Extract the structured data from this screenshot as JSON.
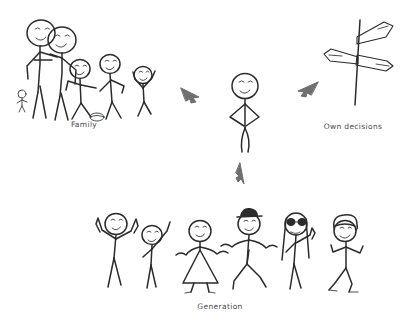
{
  "page": {
    "background_color": "#ffffff",
    "ink_color": "#2b2b2b",
    "arrow_color": "#6f6f6f",
    "width": 414,
    "height": 328
  },
  "captions": {
    "family": "Family",
    "own_decisions": "Own decisions",
    "generation": "Generation"
  },
  "groups": {
    "family": {
      "label": "Family",
      "figure_count": 6,
      "figures": [
        {
          "name": "parent-left",
          "pose": "standing, arm around partner",
          "features": "smiling face"
        },
        {
          "name": "parent-right",
          "pose": "standing, arm around partner",
          "features": "smiling face"
        },
        {
          "name": "toddler",
          "pose": "small figure at parents' feet",
          "features": "tiny child"
        },
        {
          "name": "child-1",
          "pose": "walking, arms out",
          "features": "smiling face, ball at feet"
        },
        {
          "name": "child-2",
          "pose": "standing, arms out",
          "features": "smiling face"
        },
        {
          "name": "child-3",
          "pose": "arms raised up",
          "features": "smiling face"
        }
      ],
      "props": [
        "ball"
      ]
    },
    "generation": {
      "label": "Generation",
      "figure_count": 6,
      "figures": [
        {
          "name": "peer-1",
          "pose": "both arms raised overhead",
          "features": "smiling face"
        },
        {
          "name": "peer-2",
          "pose": "one arm raised waving",
          "features": "smiling face"
        },
        {
          "name": "peer-3",
          "pose": "arms outstretched, holding hands",
          "features": "wearing a dress"
        },
        {
          "name": "peer-4",
          "pose": "arms outstretched, holding hands, legs striding",
          "features": "wearing a hat"
        },
        {
          "name": "peer-5",
          "pose": "hand raised",
          "features": "sunglasses and long hair"
        },
        {
          "name": "peer-6",
          "pose": "walking, arms bent",
          "features": "curly hair"
        }
      ]
    },
    "own_decisions": {
      "label": "Own decisions",
      "icon": "signpost-icon",
      "description": "signpost with two crossing direction arrows on a vertical post"
    },
    "center": {
      "name": "individual",
      "pose": "standing with hands on hips",
      "features": "smiling face"
    }
  },
  "arrows": [
    {
      "name": "arrow-family-to-center",
      "direction": "right",
      "from": "family",
      "to": "individual"
    },
    {
      "name": "arrow-decisions-to-center",
      "direction": "left",
      "from": "own_decisions",
      "to": "individual"
    },
    {
      "name": "arrow-generation-to-center",
      "direction": "up",
      "from": "generation",
      "to": "individual"
    }
  ]
}
